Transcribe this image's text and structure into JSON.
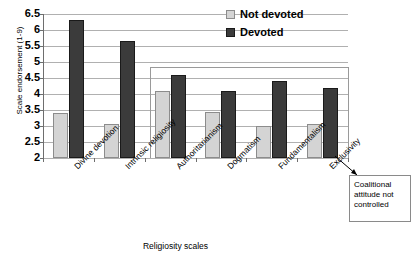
{
  "chart_data": {
    "type": "bar",
    "title": "",
    "xlabel": "Religiosity scales",
    "ylabel": "Scale endorsement (1-9)",
    "categories": [
      "Divine devotion",
      "Intrinsic religiosity",
      "Authoritarianism",
      "Dogmatism",
      "Fundamentalism",
      "Exclusivity"
    ],
    "series": [
      {
        "name": "Not devoted",
        "color": "#d4d4d4",
        "values": [
          3.4,
          3.05,
          4.1,
          3.45,
          3.0,
          3.05
        ]
      },
      {
        "name": "Devoted",
        "color": "#3b3b3b",
        "values": [
          6.3,
          5.67,
          4.6,
          4.1,
          4.4,
          4.2
        ]
      }
    ],
    "ylim": [
      2,
      6.5
    ],
    "ytick_step": 0.5,
    "ytick_labels": [
      "6.5",
      "6",
      "5.5",
      "5",
      "4.5",
      "4",
      "3.5",
      "3",
      "2.5",
      "2"
    ],
    "grid": true,
    "legend_position": "top-right"
  },
  "legend": {
    "entries": [
      {
        "label": "Not devoted",
        "swatch": "light"
      },
      {
        "label": "Devoted",
        "swatch": "dark"
      }
    ]
  },
  "annotation": {
    "callout_text": "Coalitional attitude not controlled",
    "callout_lines": [
      "Coalitional",
      "attitude not",
      "controlled"
    ]
  }
}
